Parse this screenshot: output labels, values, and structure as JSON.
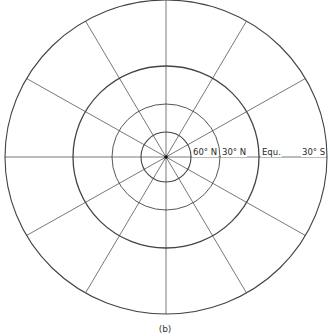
{
  "figure": {
    "caption": "(b)",
    "projection": "polar stereographic-style graticule centered on North Pole",
    "center": {
      "x": 166,
      "y": 157
    },
    "line_color": "#444444",
    "circles": [
      {
        "name": "outer-boundary-30S",
        "rx": 161,
        "ry": 157,
        "stroke_width": 1.1
      },
      {
        "name": "equator",
        "rx": 93,
        "ry": 91,
        "stroke_width": 1.3
      },
      {
        "name": "30N",
        "rx": 54,
        "ry": 53,
        "stroke_width": 0.9
      },
      {
        "name": "60N",
        "rx": 25,
        "ry": 25,
        "stroke_width": 1.1
      }
    ],
    "meridian_interval_deg": 30,
    "meridian_count": 12
  },
  "labels": [
    {
      "text": "60° N",
      "x": 192,
      "y": 147
    },
    {
      "text": "30° N",
      "x": 221,
      "y": 147
    },
    {
      "text": "Equ.",
      "x": 261,
      "y": 147
    },
    {
      "text": "30° S",
      "x": 301,
      "y": 147
    }
  ]
}
